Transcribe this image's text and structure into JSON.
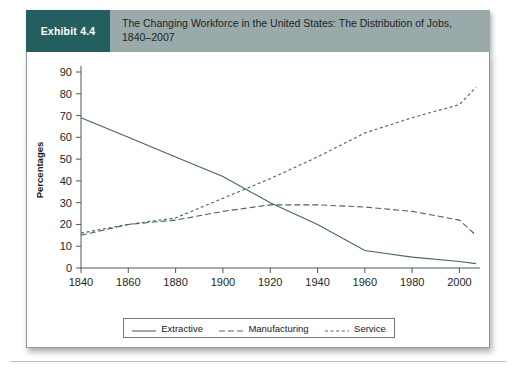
{
  "header": {
    "exhibit_label": "Exhibit 4.4",
    "title": "The Changing Workforce in the United States: The Distribution of Jobs, 1840–2007"
  },
  "legend": {
    "items": [
      {
        "label": "Extractive",
        "style": "solid"
      },
      {
        "label": "Manufacturing",
        "style": "dashed"
      },
      {
        "label": "Service",
        "style": "dotted"
      }
    ]
  },
  "axes": {
    "y_title": "Percentages",
    "y_ticks": [
      "0",
      "10",
      "20",
      "30",
      "40",
      "50",
      "60",
      "70",
      "80",
      "90"
    ],
    "x_ticks": [
      "1840",
      "1860",
      "1880",
      "1900",
      "1920",
      "1940",
      "1960",
      "1980",
      "2000"
    ]
  },
  "chart_data": {
    "type": "line",
    "title": "The Changing Workforce in the United States: The Distribution of Jobs, 1840–2007",
    "xlabel": "",
    "ylabel": "Percentages",
    "xlim": [
      1840,
      2007
    ],
    "ylim": [
      0,
      90
    ],
    "grid": false,
    "legend_position": "bottom",
    "x": [
      1840,
      1860,
      1880,
      1900,
      1920,
      1940,
      1960,
      1980,
      2000,
      2007
    ],
    "series": [
      {
        "name": "Extractive",
        "style": "solid",
        "values": [
          69,
          60,
          51,
          42,
          30,
          20,
          8,
          5,
          3,
          2
        ]
      },
      {
        "name": "Manufacturing",
        "style": "dashed",
        "values": [
          15,
          20,
          22,
          26,
          29,
          29,
          28,
          26,
          22,
          15
        ]
      },
      {
        "name": "Service",
        "style": "dotted",
        "values": [
          16,
          20,
          23,
          32,
          41,
          51,
          62,
          69,
          75,
          83
        ]
      }
    ]
  },
  "footer": {
    "source_note": ""
  }
}
